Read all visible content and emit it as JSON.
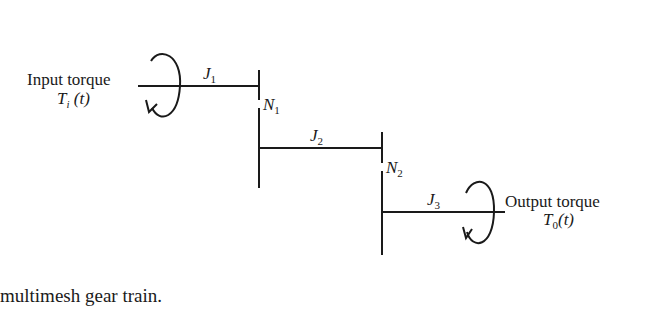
{
  "diagram": {
    "input_label": "Input torque",
    "input_symbol": "T",
    "input_sub": "i",
    "input_arg": " (t)",
    "output_label": "Output torque",
    "output_symbol": "T",
    "output_sub": "0",
    "output_arg": "(t)",
    "inertias": [
      {
        "symbol": "J",
        "sub": "1"
      },
      {
        "symbol": "J",
        "sub": "2"
      },
      {
        "symbol": "J",
        "sub": "3"
      }
    ],
    "gears": [
      {
        "symbol": "N",
        "sub": "1"
      },
      {
        "symbol": "N",
        "sub": "2"
      }
    ]
  },
  "caption": "multimesh gear train."
}
